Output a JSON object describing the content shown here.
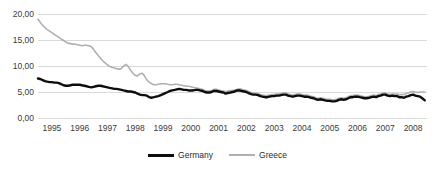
{
  "chart_data": {
    "type": "line",
    "title": "",
    "xlabel": "",
    "ylabel": "",
    "ylim": [
      0,
      20
    ],
    "xlim": [
      1995,
      2009
    ],
    "grid": true,
    "legend_position": "bottom-center",
    "y_ticks": [
      "0,00",
      "5,00",
      "10,00",
      "15,00",
      "20,00"
    ],
    "y_tick_values": [
      0,
      5,
      10,
      15,
      20
    ],
    "x_ticks": [
      "1995",
      "1996",
      "1997",
      "1998",
      "1999",
      "2000",
      "2001",
      "2002",
      "2003",
      "2004",
      "2005",
      "2006",
      "2007",
      "2008"
    ],
    "x_tick_values": [
      1995,
      1996,
      1997,
      1998,
      1999,
      2000,
      2001,
      2002,
      2003,
      2004,
      2005,
      2006,
      2007,
      2008
    ],
    "colors": {
      "germany": "#0d0d0d",
      "greece": "#b0b0b0",
      "gridline": "#d9d9d9",
      "background": "#ffffff",
      "text": "#3a3a3a"
    },
    "series": [
      {
        "name": "Germany",
        "color": "#0d0d0d",
        "x": [
          1995.0,
          1995.08,
          1995.17,
          1995.25,
          1995.33,
          1995.42,
          1995.5,
          1995.58,
          1995.67,
          1995.75,
          1995.83,
          1995.92,
          1996.0,
          1996.08,
          1996.17,
          1996.25,
          1996.33,
          1996.42,
          1996.5,
          1996.58,
          1996.67,
          1996.75,
          1996.83,
          1996.92,
          1997.0,
          1997.08,
          1997.17,
          1997.25,
          1997.33,
          1997.42,
          1997.5,
          1997.58,
          1997.67,
          1997.75,
          1997.83,
          1997.92,
          1998.0,
          1998.08,
          1998.17,
          1998.25,
          1998.33,
          1998.42,
          1998.5,
          1998.58,
          1998.67,
          1998.75,
          1998.83,
          1998.92,
          1999.0,
          1999.08,
          1999.17,
          1999.25,
          1999.33,
          1999.42,
          1999.5,
          1999.58,
          1999.67,
          1999.75,
          1999.83,
          1999.92,
          2000.0,
          2000.08,
          2000.17,
          2000.25,
          2000.33,
          2000.42,
          2000.5,
          2000.58,
          2000.67,
          2000.75,
          2000.83,
          2000.92,
          2001.0,
          2001.08,
          2001.17,
          2001.25,
          2001.33,
          2001.42,
          2001.5,
          2001.58,
          2001.67,
          2001.75,
          2001.83,
          2001.92,
          2002.0,
          2002.08,
          2002.17,
          2002.25,
          2002.33,
          2002.42,
          2002.5,
          2002.58,
          2002.67,
          2002.75,
          2002.83,
          2002.92,
          2003.0,
          2003.08,
          2003.17,
          2003.25,
          2003.33,
          2003.42,
          2003.5,
          2003.58,
          2003.67,
          2003.75,
          2003.83,
          2003.92,
          2004.0,
          2004.08,
          2004.17,
          2004.25,
          2004.33,
          2004.42,
          2004.5,
          2004.58,
          2004.67,
          2004.75,
          2004.83,
          2004.92,
          2005.0,
          2005.08,
          2005.17,
          2005.25,
          2005.33,
          2005.42,
          2005.5,
          2005.58,
          2005.67,
          2005.75,
          2005.83,
          2005.92,
          2006.0,
          2006.08,
          2006.17,
          2006.25,
          2006.33,
          2006.42,
          2006.5,
          2006.58,
          2006.67,
          2006.75,
          2006.83,
          2006.92,
          2007.0,
          2007.08,
          2007.17,
          2007.25,
          2007.33,
          2007.42,
          2007.5,
          2007.58,
          2007.67,
          2007.75,
          2007.83,
          2007.92,
          2008.0,
          2008.08,
          2008.17,
          2008.25,
          2008.33,
          2008.42,
          2008.5,
          2008.58,
          2008.67,
          2008.75,
          2008.83,
          2008.92
        ],
        "values": [
          7.6,
          7.5,
          7.3,
          7.1,
          7.0,
          6.9,
          6.9,
          6.8,
          6.8,
          6.7,
          6.5,
          6.3,
          6.2,
          6.2,
          6.3,
          6.4,
          6.4,
          6.4,
          6.4,
          6.3,
          6.2,
          6.1,
          6.0,
          5.9,
          6.0,
          6.1,
          6.2,
          6.2,
          6.1,
          6.0,
          5.9,
          5.8,
          5.7,
          5.6,
          5.6,
          5.5,
          5.4,
          5.3,
          5.2,
          5.1,
          5.1,
          5.0,
          4.9,
          4.7,
          4.5,
          4.4,
          4.4,
          4.3,
          4.0,
          3.9,
          4.0,
          4.1,
          4.2,
          4.4,
          4.6,
          4.8,
          5.0,
          5.2,
          5.3,
          5.4,
          5.5,
          5.6,
          5.5,
          5.4,
          5.4,
          5.3,
          5.3,
          5.3,
          5.4,
          5.4,
          5.3,
          5.2,
          5.0,
          4.9,
          4.9,
          5.0,
          5.2,
          5.2,
          5.1,
          5.0,
          4.9,
          4.7,
          4.8,
          4.9,
          5.0,
          5.1,
          5.3,
          5.3,
          5.2,
          5.1,
          5.0,
          4.8,
          4.6,
          4.5,
          4.5,
          4.4,
          4.2,
          4.1,
          4.0,
          4.0,
          4.1,
          4.2,
          4.2,
          4.3,
          4.3,
          4.4,
          4.5,
          4.5,
          4.3,
          4.2,
          4.1,
          4.2,
          4.3,
          4.3,
          4.2,
          4.1,
          4.1,
          4.0,
          3.9,
          3.8,
          3.6,
          3.5,
          3.6,
          3.5,
          3.4,
          3.3,
          3.3,
          3.2,
          3.2,
          3.3,
          3.5,
          3.6,
          3.5,
          3.6,
          3.8,
          4.0,
          4.0,
          4.1,
          4.1,
          4.0,
          3.9,
          3.8,
          3.8,
          3.9,
          4.0,
          4.1,
          4.0,
          4.2,
          4.3,
          4.5,
          4.5,
          4.3,
          4.2,
          4.3,
          4.2,
          4.2,
          4.0,
          4.0,
          3.9,
          4.1,
          4.2,
          4.4,
          4.5,
          4.3,
          4.2,
          4.1,
          3.8,
          3.4
        ]
      },
      {
        "name": "Greece",
        "color": "#b0b0b0",
        "x": [
          1995.0,
          1995.08,
          1995.17,
          1995.25,
          1995.33,
          1995.42,
          1995.5,
          1995.58,
          1995.67,
          1995.75,
          1995.83,
          1995.92,
          1996.0,
          1996.08,
          1996.17,
          1996.25,
          1996.33,
          1996.42,
          1996.5,
          1996.58,
          1996.67,
          1996.75,
          1996.83,
          1996.92,
          1997.0,
          1997.08,
          1997.17,
          1997.25,
          1997.33,
          1997.42,
          1997.5,
          1997.58,
          1997.67,
          1997.75,
          1997.83,
          1997.92,
          1998.0,
          1998.08,
          1998.17,
          1998.25,
          1998.33,
          1998.42,
          1998.5,
          1998.58,
          1998.67,
          1998.75,
          1998.83,
          1998.92,
          1999.0,
          1999.08,
          1999.17,
          1999.25,
          1999.33,
          1999.42,
          1999.5,
          1999.58,
          1999.67,
          1999.75,
          1999.83,
          1999.92,
          2000.0,
          2000.08,
          2000.17,
          2000.25,
          2000.33,
          2000.42,
          2000.5,
          2000.58,
          2000.67,
          2000.75,
          2000.83,
          2000.92,
          2001.0,
          2001.08,
          2001.17,
          2001.25,
          2001.33,
          2001.42,
          2001.5,
          2001.58,
          2001.67,
          2001.75,
          2001.83,
          2001.92,
          2002.0,
          2002.08,
          2002.17,
          2002.25,
          2002.33,
          2002.42,
          2002.5,
          2002.58,
          2002.67,
          2002.75,
          2002.83,
          2002.92,
          2003.0,
          2003.08,
          2003.17,
          2003.25,
          2003.33,
          2003.42,
          2003.5,
          2003.58,
          2003.67,
          2003.75,
          2003.83,
          2003.92,
          2004.0,
          2004.08,
          2004.17,
          2004.25,
          2004.33,
          2004.42,
          2004.5,
          2004.58,
          2004.67,
          2004.75,
          2004.83,
          2004.92,
          2005.0,
          2005.08,
          2005.17,
          2005.25,
          2005.33,
          2005.42,
          2005.5,
          2005.58,
          2005.67,
          2005.75,
          2005.83,
          2005.92,
          2006.0,
          2006.08,
          2006.17,
          2006.25,
          2006.33,
          2006.42,
          2006.5,
          2006.58,
          2006.67,
          2006.75,
          2006.83,
          2006.92,
          2007.0,
          2007.08,
          2007.17,
          2007.25,
          2007.33,
          2007.42,
          2007.5,
          2007.58,
          2007.67,
          2007.75,
          2007.83,
          2007.92,
          2008.0,
          2008.08,
          2008.17,
          2008.25,
          2008.33,
          2008.42,
          2008.5,
          2008.58,
          2008.67,
          2008.75,
          2008.83,
          2008.92
        ],
        "values": [
          19.0,
          18.4,
          17.8,
          17.4,
          17.0,
          16.7,
          16.4,
          16.1,
          15.8,
          15.5,
          15.2,
          14.9,
          14.6,
          14.4,
          14.3,
          14.2,
          14.2,
          14.1,
          14.0,
          13.9,
          14.0,
          14.0,
          13.9,
          13.7,
          13.2,
          12.6,
          12.0,
          11.5,
          11.0,
          10.6,
          10.2,
          9.9,
          9.7,
          9.6,
          9.5,
          9.4,
          9.5,
          10.0,
          10.3,
          9.9,
          9.2,
          8.6,
          8.2,
          8.1,
          8.5,
          8.6,
          8.1,
          7.3,
          6.9,
          6.6,
          6.4,
          6.4,
          6.5,
          6.6,
          6.6,
          6.6,
          6.5,
          6.4,
          6.4,
          6.5,
          6.5,
          6.4,
          6.3,
          6.2,
          6.1,
          6.1,
          6.0,
          5.9,
          5.8,
          5.7,
          5.6,
          5.5,
          5.3,
          5.2,
          5.2,
          5.3,
          5.5,
          5.5,
          5.4,
          5.3,
          5.2,
          5.1,
          5.2,
          5.3,
          5.3,
          5.4,
          5.5,
          5.6,
          5.5,
          5.4,
          5.3,
          5.1,
          4.9,
          4.8,
          4.8,
          4.7,
          4.5,
          4.4,
          4.3,
          4.3,
          4.4,
          4.5,
          4.5,
          4.6,
          4.6,
          4.7,
          4.8,
          4.8,
          4.6,
          4.5,
          4.4,
          4.5,
          4.6,
          4.6,
          4.5,
          4.4,
          4.4,
          4.3,
          4.2,
          4.1,
          3.9,
          3.8,
          3.9,
          3.8,
          3.7,
          3.6,
          3.6,
          3.5,
          3.5,
          3.6,
          3.8,
          3.9,
          3.8,
          3.9,
          4.1,
          4.3,
          4.3,
          4.4,
          4.4,
          4.3,
          4.2,
          4.1,
          4.1,
          4.2,
          4.3,
          4.4,
          4.3,
          4.5,
          4.6,
          4.8,
          4.8,
          4.6,
          4.5,
          4.6,
          4.6,
          4.6,
          4.5,
          4.5,
          4.5,
          4.7,
          4.8,
          5.0,
          5.1,
          5.0,
          4.9,
          5.0,
          5.0,
          5.0
        ]
      }
    ],
    "legend": [
      {
        "label": "Germany",
        "color": "#0d0d0d",
        "swatch": "thick-line"
      },
      {
        "label": "Greece",
        "color": "#b0b0b0",
        "swatch": "thin-line"
      }
    ]
  }
}
